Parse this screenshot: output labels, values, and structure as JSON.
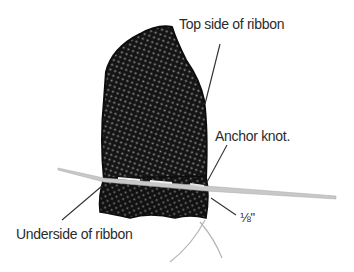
{
  "figure": {
    "labels": {
      "top_side": "Top side of ribbon",
      "anchor_knot": "Anchor knot.",
      "measurement": "⅛\"",
      "underside": "Underside of ribbon"
    },
    "colors": {
      "ribbon": "#141414",
      "ribbon_highlight": "#8a8a8a",
      "needle": "#c8c8c8",
      "thread": "#b5b5b5",
      "leader_line": "#333333",
      "text": "#2b2b2b"
    }
  }
}
